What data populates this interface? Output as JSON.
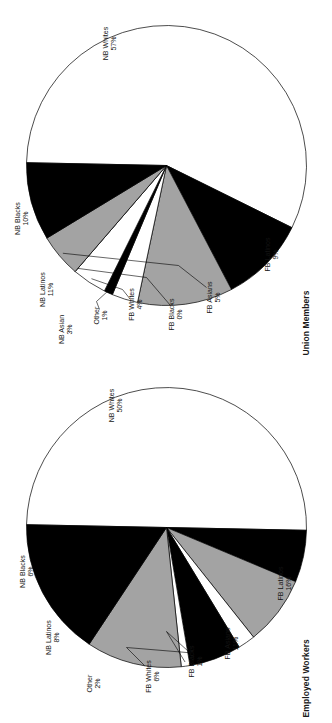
{
  "figure": {
    "orientation": "page rotated 90 degrees counter-clockwise",
    "background": "#ffffff",
    "ink": "#000000"
  },
  "palette": {
    "white": "#ffffff",
    "black": "#000000",
    "gray": "#a3a3a3",
    "outline": "#000000"
  },
  "charts": [
    {
      "id": "union",
      "title": "Union Members",
      "slices": [
        {
          "label": "NB Whites",
          "pct_text": "57%",
          "value": 57,
          "fill": "#ffffff"
        },
        {
          "label": "NB Blacks",
          "pct_text": "10%",
          "value": 10,
          "fill": "#000000"
        },
        {
          "label": "NB Latinos",
          "pct_text": "11%",
          "value": 11,
          "fill": "#a3a3a3"
        },
        {
          "label": "NB Asian",
          "pct_text": "3%",
          "value": 3,
          "fill": "#ffffff"
        },
        {
          "label": "Other",
          "pct_text": "1%",
          "value": 1,
          "fill": "#000000"
        },
        {
          "label": "FB Whites",
          "pct_text": "4%",
          "value": 4,
          "fill": "#ffffff"
        },
        {
          "label": "FB Blacks",
          "pct_text": "0%",
          "value": 0,
          "fill": "#000000"
        },
        {
          "label": "FB Asians",
          "pct_text": "5%",
          "value": 5,
          "fill": "#a3a3a3"
        },
        {
          "label": "FB Latinos",
          "pct_text": "9%",
          "value": 9,
          "fill": "#000000"
        }
      ]
    },
    {
      "id": "employed",
      "title": "Employed Workers",
      "slices": [
        {
          "label": "NB Whites",
          "pct_text": "50%",
          "value": 50,
          "fill": "#ffffff"
        },
        {
          "label": "NB Blacks",
          "pct_text": "6%",
          "value": 6,
          "fill": "#000000"
        },
        {
          "label": "NB Latinos",
          "pct_text": "8%",
          "value": 8,
          "fill": "#a3a3a3"
        },
        {
          "label": "Other",
          "pct_text": "2%",
          "value": 2,
          "fill": "#ffffff"
        },
        {
          "label": "FB Whites",
          "pct_text": "6%",
          "value": 6,
          "fill": "#000000"
        },
        {
          "label": "FB Blacks",
          "pct_text": "1%",
          "value": 1,
          "fill": "#ffffff"
        },
        {
          "label": "FB Asians",
          "pct_text": "11%",
          "value": 11,
          "fill": "#a3a3a3"
        },
        {
          "label": "FB Latinos",
          "pct_text": "16%",
          "value": 16,
          "fill": "#000000"
        }
      ]
    }
  ],
  "chart_data": [
    {
      "type": "pie",
      "title": "Union Members",
      "categories": [
        "NB Whites",
        "NB Blacks",
        "NB Latinos",
        "NB Asian",
        "Other",
        "FB Whites",
        "FB Blacks",
        "FB Asians",
        "FB Latinos"
      ],
      "values": [
        57,
        10,
        11,
        3,
        1,
        4,
        0,
        5,
        9
      ],
      "value_labels": [
        "57%",
        "10%",
        "11%",
        "3%",
        "1%",
        "4%",
        "0%",
        "5%",
        "9%"
      ],
      "units": "percent",
      "legend": "none (direct slice labels with leader lines)",
      "start_angle_deg": 0,
      "direction": "clockwise"
    },
    {
      "type": "pie",
      "title": "Employed Workers",
      "categories": [
        "NB Whites",
        "NB Blacks",
        "NB Latinos",
        "Other",
        "FB Whites",
        "FB Blacks",
        "FB Asians",
        "FB Latinos"
      ],
      "values": [
        50,
        6,
        8,
        2,
        6,
        1,
        11,
        16
      ],
      "value_labels": [
        "50%",
        "6%",
        "8%",
        "2%",
        "6%",
        "1%",
        "11%",
        "16%"
      ],
      "units": "percent",
      "legend": "none (direct slice labels with leader lines)",
      "start_angle_deg": 0,
      "direction": "clockwise"
    }
  ]
}
